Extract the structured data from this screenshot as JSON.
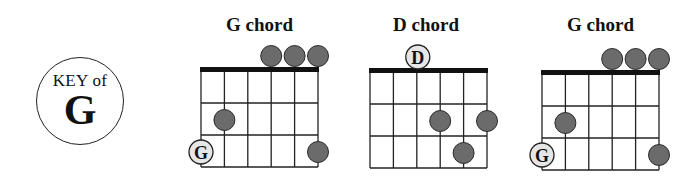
{
  "key_badge": {
    "label": "KEY of",
    "note": "G"
  },
  "colors": {
    "dot": "#6b6b6b",
    "dot_stroke": "#2a2a2a",
    "root_fill": "#e6e6e6",
    "grid": "#222222",
    "nut": "#111111"
  },
  "chords": [
    {
      "title": "G chord",
      "open_strings": [
        3,
        4,
        5
      ],
      "fretted": [
        {
          "string": 1,
          "fret": 2
        },
        {
          "string": 5,
          "fret": 3
        }
      ],
      "root": {
        "string": 0,
        "fret": 3,
        "label": "G"
      }
    },
    {
      "title": "D chord",
      "open_strings": [],
      "open_root": {
        "string": 2,
        "label": "D"
      },
      "fretted": [
        {
          "string": 3,
          "fret": 2
        },
        {
          "string": 5,
          "fret": 2
        },
        {
          "string": 4,
          "fret": 3
        }
      ]
    },
    {
      "title": "G chord",
      "open_strings": [
        3,
        4,
        5
      ],
      "fretted": [
        {
          "string": 1,
          "fret": 2
        },
        {
          "string": 5,
          "fret": 3
        }
      ],
      "root": {
        "string": 0,
        "fret": 3,
        "label": "G"
      }
    }
  ]
}
